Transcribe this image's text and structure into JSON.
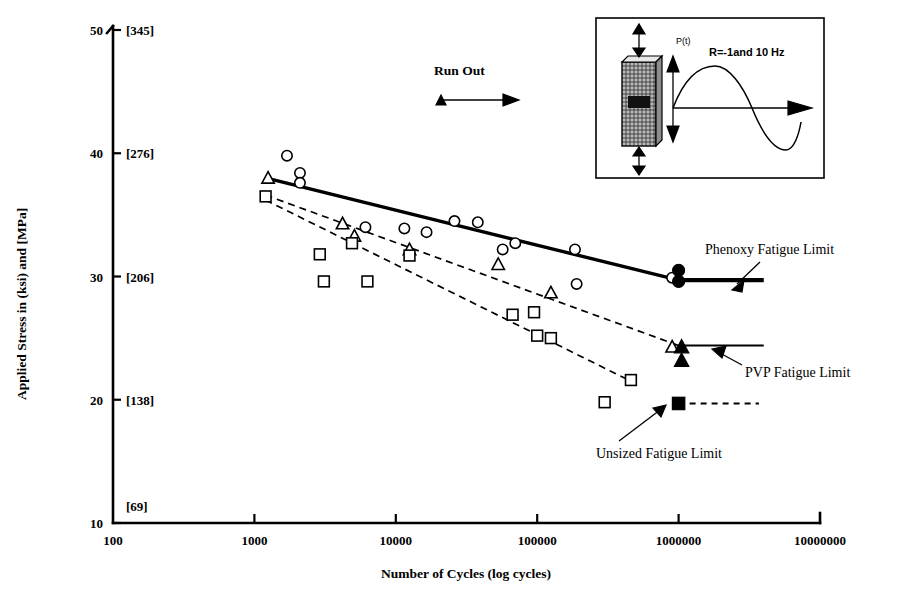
{
  "figure": {
    "y_axis": {
      "label": "Applied Stress in (ksi) and [MPa]",
      "ticks_ksi": [
        10,
        20,
        30,
        40,
        50
      ],
      "ticks_mpa": [
        "[69]",
        "[138]",
        "[206]",
        "[276]",
        "[345]"
      ],
      "min": 10,
      "max": 50
    },
    "x_axis": {
      "label": "Number of Cycles (log cycles)",
      "ticks": [
        "100",
        "1000",
        "10000",
        "100000",
        "1000000",
        "10000000"
      ],
      "min": 100,
      "max": 10000000
    },
    "annotations": {
      "run_out": "Run Out",
      "phenoxy_limit": "Phenoxy  Fatigue Limit",
      "pvp_limit": "PVP Fatigue Limit",
      "unsized_limit": "Unsized Fatigue Limit"
    },
    "inset": {
      "load_label": "P(t)",
      "condition_label": "R=-1and 10 Hz"
    }
  },
  "chart_data": {
    "type": "scatter",
    "title": "",
    "xlabel": "Number of Cycles (log cycles)",
    "ylabel": "Applied Stress in (ksi) and [MPa]",
    "xscale": "log",
    "xlim": [
      100,
      10000000
    ],
    "ylim": [
      10,
      50
    ],
    "grid": false,
    "legend": "none",
    "y_secondary_ticks_mpa": [
      69,
      138,
      206,
      276,
      345
    ],
    "series": [
      {
        "name": "Phenoxy sized",
        "marker": "open-circle",
        "points": [
          {
            "x": 1700,
            "y": 39.8
          },
          {
            "x": 2100,
            "y": 38.4
          },
          {
            "x": 2100,
            "y": 37.6
          },
          {
            "x": 6100,
            "y": 34.0
          },
          {
            "x": 11500,
            "y": 33.9
          },
          {
            "x": 16500,
            "y": 33.6
          },
          {
            "x": 26000,
            "y": 34.5
          },
          {
            "x": 38000,
            "y": 34.4
          },
          {
            "x": 57000,
            "y": 32.2
          },
          {
            "x": 70000,
            "y": 32.7
          },
          {
            "x": 185000,
            "y": 32.2
          },
          {
            "x": 190000,
            "y": 29.4
          },
          {
            "x": 900000,
            "y": 29.9
          }
        ]
      },
      {
        "name": "Phenoxy run-out",
        "marker": "solid-circle",
        "points": [
          {
            "x": 1000000,
            "y": 30.5
          },
          {
            "x": 1000000,
            "y": 29.6
          }
        ]
      },
      {
        "name": "PVP sized",
        "marker": "open-triangle",
        "points": [
          {
            "x": 1250,
            "y": 38.0
          },
          {
            "x": 4200,
            "y": 34.3
          },
          {
            "x": 5100,
            "y": 33.3
          },
          {
            "x": 12500,
            "y": 32.2
          },
          {
            "x": 53000,
            "y": 31.0
          },
          {
            "x": 125000,
            "y": 28.7
          },
          {
            "x": 900000,
            "y": 24.3
          }
        ]
      },
      {
        "name": "PVP run-out",
        "marker": "solid-triangle",
        "points": [
          {
            "x": 1050000,
            "y": 24.3
          },
          {
            "x": 1050000,
            "y": 23.2
          }
        ]
      },
      {
        "name": "Unsized",
        "marker": "open-square",
        "points": [
          {
            "x": 1200,
            "y": 36.5
          },
          {
            "x": 2900,
            "y": 31.8
          },
          {
            "x": 3100,
            "y": 29.6
          },
          {
            "x": 4900,
            "y": 32.7
          },
          {
            "x": 6300,
            "y": 29.6
          },
          {
            "x": 12500,
            "y": 31.7
          },
          {
            "x": 67000,
            "y": 26.9
          },
          {
            "x": 95000,
            "y": 27.1
          },
          {
            "x": 100000,
            "y": 25.2
          },
          {
            "x": 125000,
            "y": 25.0
          },
          {
            "x": 460000,
            "y": 21.6
          },
          {
            "x": 300000,
            "y": 19.8
          }
        ]
      },
      {
        "name": "Unsized run-out",
        "marker": "solid-square",
        "points": [
          {
            "x": 1000000,
            "y": 19.7
          }
        ]
      }
    ],
    "trend_lines": [
      {
        "name": "Phenoxy trend",
        "style": "solid-thick",
        "x0": 1200,
        "y0": 38.0,
        "x1": 1000000,
        "y1": 29.7
      },
      {
        "name": "PVP trend",
        "style": "dashed",
        "x0": 1200,
        "y0": 36.6,
        "x1": 1000000,
        "y1": 24.4
      },
      {
        "name": "Unsized trend",
        "style": "dashed",
        "x0": 1200,
        "y0": 36.2,
        "x1": 500000,
        "y1": 21.3
      }
    ],
    "fatigue_limits": [
      {
        "name": "Phenoxy Fatigue Limit",
        "y": 29.7,
        "x0": 1000000,
        "x1": 4000000,
        "style": "solid-thick"
      },
      {
        "name": "PVP Fatigue Limit",
        "y": 24.4,
        "x0": 1000000,
        "x1": 4000000,
        "style": "solid-thin"
      },
      {
        "name": "Unsized Fatigue Limit",
        "y": 19.7,
        "x0": 1000000,
        "x1": 3700000,
        "style": "dashed"
      }
    ]
  }
}
